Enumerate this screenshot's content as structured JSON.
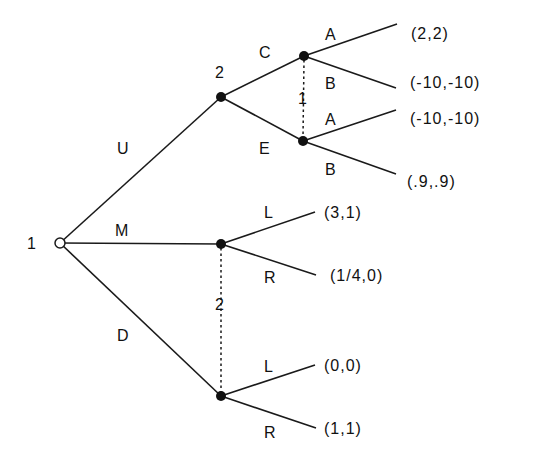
{
  "diagram": {
    "type": "extensive-form game tree",
    "root": {
      "player": "1"
    },
    "actions_player1": [
      "U",
      "M",
      "D"
    ],
    "after_U": {
      "player": "2",
      "actions": [
        "C",
        "E"
      ],
      "info_set_player": "1",
      "info_set_actions": [
        "A",
        "B"
      ],
      "payoffs": {
        "C_A": "(2,2)",
        "C_B": "(-10,-10)",
        "E_A": "(-10,-10)",
        "E_B": "(.9,.9)"
      }
    },
    "info_set_M_D": {
      "player": "2",
      "actions": [
        "L",
        "R"
      ],
      "payoffs": {
        "M_L": "(3,1)",
        "M_R": "(1/4,0)",
        "D_L": "(0,0)",
        "D_R": "(1,1)"
      }
    }
  },
  "labels": {
    "root_player": "1",
    "U": "U",
    "M": "M",
    "D": "D",
    "node_U_player": "2",
    "C": "C",
    "E": "E",
    "info_U_player": "1",
    "A1": "A",
    "B1": "B",
    "A2": "A",
    "B2": "B",
    "info_MD_player": "2",
    "L1": "L",
    "R1": "R",
    "L2": "L",
    "R2": "R"
  },
  "payoffs": {
    "CA": "(2,2)",
    "CB": "(-10,-10)",
    "EA": "(-10,-10)",
    "EB": "(.9,.9)",
    "ML": "(3,1)",
    "MR": "(1/4,0)",
    "DL": "(0,0)",
    "DR": "(1,1)"
  }
}
